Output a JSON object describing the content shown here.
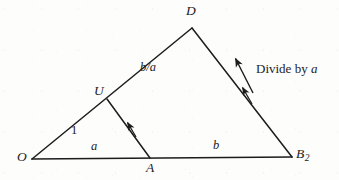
{
  "figure": {
    "type": "geometry-diagram",
    "background_color": "#fdfdfc",
    "stroke_color": "#1c1c1c"
  },
  "vertices": [
    {
      "id": "O",
      "label": "O",
      "x": 32,
      "y": 159,
      "label_x": 17,
      "label_y": 150
    },
    {
      "id": "A",
      "label": "A",
      "x": 150,
      "y": 158,
      "label_x": 146,
      "label_y": 161
    },
    {
      "id": "B2",
      "label": "B",
      "sub": "2",
      "x": 292,
      "y": 157,
      "label_x": 296,
      "label_y": 147
    },
    {
      "id": "U",
      "label": "U",
      "x": 107,
      "y": 99,
      "label_x": 94,
      "label_y": 84
    },
    {
      "id": "D",
      "label": "D",
      "x": 192,
      "y": 28,
      "label_x": 186,
      "label_y": 4
    }
  ],
  "edges": [
    {
      "id": "O-B2",
      "from": "O",
      "to": "B2",
      "x1": 32,
      "y1": 159,
      "x2": 292,
      "y2": 157
    },
    {
      "id": "O-D",
      "from": "O",
      "to": "D",
      "x1": 32,
      "y1": 159,
      "x2": 192,
      "y2": 28
    },
    {
      "id": "D-B2",
      "from": "D",
      "to": "B2",
      "x1": 192,
      "y1": 28,
      "x2": 292,
      "y2": 157
    },
    {
      "id": "U-A",
      "from": "U",
      "to": "A",
      "x1": 107,
      "y1": 99,
      "x2": 150,
      "y2": 158
    }
  ],
  "segment_labels": [
    {
      "id": "label-1",
      "text": "1",
      "x": 71,
      "y": 124,
      "edge": "O-U"
    },
    {
      "id": "label-a",
      "text": "a",
      "x": 91,
      "y": 140,
      "edge": "O-A"
    },
    {
      "id": "label-b",
      "text": "b",
      "x": 213,
      "y": 139,
      "edge": "A-B2"
    },
    {
      "id": "label-b-a",
      "text": "b/a",
      "x": 140,
      "y": 61,
      "edge": "U-D"
    }
  ],
  "annotations": [
    {
      "id": "divide-by-a",
      "text_before": "Divide by ",
      "text_italic": "a",
      "x": 256,
      "y": 62
    }
  ],
  "arrows": [
    {
      "id": "arrow-annotation",
      "x1": 253,
      "y1": 93,
      "x2": 235,
      "y2": 57,
      "head": "end"
    },
    {
      "id": "arrow-edge-db2",
      "x1": 252,
      "y1": 104,
      "x2": 241,
      "y2": 85,
      "head": "end"
    },
    {
      "id": "arrow-edge-ua",
      "x1": 136,
      "y1": 137,
      "x2": 126,
      "y2": 120,
      "head": "end"
    }
  ]
}
